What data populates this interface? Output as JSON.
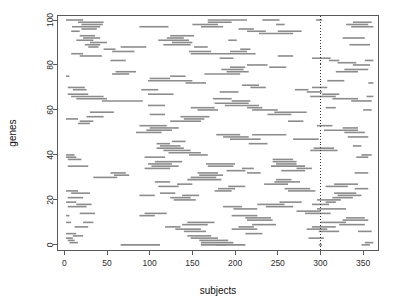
{
  "chart_data": {
    "type": "line",
    "title": "",
    "subtitle": "",
    "xlabel": "subjects",
    "ylabel": "genes",
    "xlim": [
      -8,
      368
    ],
    "ylim": [
      -2.5,
      102
    ],
    "xticks": [
      0,
      50,
      100,
      150,
      200,
      250,
      300,
      350
    ],
    "xtick_labels": [
      "0",
      "50",
      "100",
      "150",
      "200",
      "250",
      "300",
      "350"
    ],
    "yticks": [
      0,
      20,
      40,
      60,
      80,
      100
    ],
    "ytick_labels": [
      "0",
      "20",
      "40",
      "60",
      "80",
      "100"
    ],
    "grid": false,
    "legend": null,
    "series_color": "#8c8c8c",
    "annotations": [
      {
        "name": "reference-line",
        "type": "vline",
        "x": 300,
        "style": "dotted",
        "color": "#333333"
      }
    ],
    "segments": [
      {
        "gene": 100,
        "x0": 2,
        "x1": 22
      },
      {
        "gene": 100,
        "x0": 168,
        "x1": 214
      },
      {
        "gene": 100,
        "x0": 232,
        "x1": 252
      },
      {
        "gene": 100,
        "x0": 295,
        "x1": 302
      },
      {
        "gene": 99,
        "x0": 16,
        "x1": 46
      },
      {
        "gene": 99,
        "x0": 168,
        "x1": 196
      },
      {
        "gene": 99,
        "x0": 338,
        "x1": 360
      },
      {
        "gene": 98,
        "x0": 20,
        "x1": 45
      },
      {
        "gene": 98,
        "x0": 150,
        "x1": 180
      },
      {
        "gene": 98,
        "x0": 248,
        "x1": 258
      },
      {
        "gene": 98,
        "x0": 330,
        "x1": 356
      },
      {
        "gene": 97,
        "x0": 9,
        "x1": 42
      },
      {
        "gene": 97,
        "x0": 88,
        "x1": 122
      },
      {
        "gene": 97,
        "x0": 160,
        "x1": 186
      },
      {
        "gene": 97,
        "x0": 336,
        "x1": 362
      },
      {
        "gene": 96,
        "x0": 20,
        "x1": 38
      },
      {
        "gene": 96,
        "x0": 204,
        "x1": 222
      },
      {
        "gene": 95,
        "x0": 8,
        "x1": 18
      },
      {
        "gene": 95,
        "x0": 214,
        "x1": 236
      },
      {
        "gene": 95,
        "x0": 250,
        "x1": 278
      },
      {
        "gene": 94,
        "x0": 228,
        "x1": 268
      },
      {
        "gene": 93,
        "x0": 18,
        "x1": 36
      },
      {
        "gene": 93,
        "x0": 124,
        "x1": 152
      },
      {
        "gene": 92,
        "x0": 22,
        "x1": 42
      },
      {
        "gene": 92,
        "x0": 120,
        "x1": 140
      },
      {
        "gene": 92,
        "x0": 326,
        "x1": 352
      },
      {
        "gene": 91,
        "x0": 14,
        "x1": 34
      },
      {
        "gene": 91,
        "x0": 110,
        "x1": 146
      },
      {
        "gene": 91,
        "x0": 192,
        "x1": 202
      },
      {
        "gene": 90,
        "x0": 30,
        "x1": 50
      },
      {
        "gene": 90,
        "x0": 126,
        "x1": 150
      },
      {
        "gene": 89,
        "x0": 24,
        "x1": 42
      },
      {
        "gene": 89,
        "x0": 116,
        "x1": 148
      },
      {
        "gene": 89,
        "x0": 334,
        "x1": 358
      },
      {
        "gene": 88,
        "x0": 28,
        "x1": 40
      },
      {
        "gene": 88,
        "x0": 66,
        "x1": 96
      },
      {
        "gene": 88,
        "x0": 152,
        "x1": 168
      },
      {
        "gene": 87,
        "x0": 46,
        "x1": 60
      },
      {
        "gene": 87,
        "x0": 206,
        "x1": 218
      },
      {
        "gene": 86,
        "x0": 56,
        "x1": 82
      },
      {
        "gene": 86,
        "x0": 146,
        "x1": 172
      },
      {
        "gene": 86,
        "x0": 194,
        "x1": 214
      },
      {
        "gene": 85,
        "x0": 8,
        "x1": 22
      },
      {
        "gene": 85,
        "x0": 148,
        "x1": 224
      },
      {
        "gene": 84,
        "x0": 18,
        "x1": 44
      },
      {
        "gene": 84,
        "x0": 250,
        "x1": 268
      },
      {
        "gene": 83,
        "x0": 182,
        "x1": 198
      },
      {
        "gene": 83,
        "x0": 290,
        "x1": 312
      },
      {
        "gene": 82,
        "x0": 54,
        "x1": 72
      },
      {
        "gene": 82,
        "x0": 310,
        "x1": 322
      },
      {
        "gene": 82,
        "x0": 352,
        "x1": 362
      },
      {
        "gene": 81,
        "x0": 320,
        "x1": 342
      },
      {
        "gene": 80,
        "x0": 214,
        "x1": 238
      },
      {
        "gene": 80,
        "x0": 338,
        "x1": 358
      },
      {
        "gene": 79,
        "x0": 194,
        "x1": 212
      },
      {
        "gene": 79,
        "x0": 240,
        "x1": 260
      },
      {
        "gene": 78,
        "x0": 184,
        "x1": 210
      },
      {
        "gene": 78,
        "x0": 328,
        "x1": 356
      },
      {
        "gene": 77,
        "x0": 60,
        "x1": 84
      },
      {
        "gene": 77,
        "x0": 190,
        "x1": 216
      },
      {
        "gene": 77,
        "x0": 318,
        "x1": 344
      },
      {
        "gene": 76,
        "x0": 56,
        "x1": 76
      },
      {
        "gene": 76,
        "x0": 164,
        "x1": 206
      },
      {
        "gene": 75,
        "x0": 2,
        "x1": 6
      },
      {
        "gene": 75,
        "x0": 124,
        "x1": 142
      },
      {
        "gene": 74,
        "x0": 100,
        "x1": 124
      },
      {
        "gene": 73,
        "x0": 98,
        "x1": 150
      },
      {
        "gene": 73,
        "x0": 308,
        "x1": 328
      },
      {
        "gene": 72,
        "x0": 142,
        "x1": 166
      },
      {
        "gene": 72,
        "x0": 356,
        "x1": 362
      },
      {
        "gene": 71,
        "x0": 208,
        "x1": 228
      },
      {
        "gene": 70,
        "x0": 4,
        "x1": 24
      },
      {
        "gene": 70,
        "x0": 218,
        "x1": 236
      },
      {
        "gene": 70,
        "x0": 290,
        "x1": 308
      },
      {
        "gene": 69,
        "x0": 10,
        "x1": 26
      },
      {
        "gene": 69,
        "x0": 90,
        "x1": 110
      },
      {
        "gene": 69,
        "x0": 270,
        "x1": 286
      },
      {
        "gene": 68,
        "x0": 182,
        "x1": 204
      },
      {
        "gene": 68,
        "x0": 284,
        "x1": 302
      },
      {
        "gene": 67,
        "x0": 4,
        "x1": 28
      },
      {
        "gene": 67,
        "x0": 98,
        "x1": 128
      },
      {
        "gene": 67,
        "x0": 302,
        "x1": 322
      },
      {
        "gene": 66,
        "x0": 8,
        "x1": 46
      },
      {
        "gene": 66,
        "x0": 288,
        "x1": 318
      },
      {
        "gene": 66,
        "x0": 354,
        "x1": 362
      },
      {
        "gene": 65,
        "x0": 14,
        "x1": 50
      },
      {
        "gene": 65,
        "x0": 174,
        "x1": 196
      },
      {
        "gene": 65,
        "x0": 314,
        "x1": 344
      },
      {
        "gene": 64,
        "x0": 44,
        "x1": 92
      },
      {
        "gene": 64,
        "x0": 196,
        "x1": 218
      },
      {
        "gene": 64,
        "x0": 336,
        "x1": 360
      },
      {
        "gene": 63,
        "x0": 176,
        "x1": 216
      },
      {
        "gene": 62,
        "x0": 98,
        "x1": 118
      },
      {
        "gene": 62,
        "x0": 188,
        "x1": 228
      },
      {
        "gene": 61,
        "x0": 148,
        "x1": 176
      },
      {
        "gene": 61,
        "x0": 214,
        "x1": 232
      },
      {
        "gene": 61,
        "x0": 306,
        "x1": 318
      },
      {
        "gene": 60,
        "x0": 156,
        "x1": 180
      },
      {
        "gene": 60,
        "x0": 220,
        "x1": 250
      },
      {
        "gene": 60,
        "x0": 350,
        "x1": 360
      },
      {
        "gene": 59,
        "x0": 30,
        "x1": 58
      },
      {
        "gene": 59,
        "x0": 246,
        "x1": 284
      },
      {
        "gene": 58,
        "x0": 100,
        "x1": 118
      },
      {
        "gene": 58,
        "x0": 238,
        "x1": 266
      },
      {
        "gene": 57,
        "x0": 26,
        "x1": 46
      },
      {
        "gene": 57,
        "x0": 136,
        "x1": 170
      },
      {
        "gene": 56,
        "x0": 2,
        "x1": 16
      },
      {
        "gene": 56,
        "x0": 140,
        "x1": 164
      },
      {
        "gene": 55,
        "x0": 18,
        "x1": 34
      },
      {
        "gene": 55,
        "x0": 124,
        "x1": 160
      },
      {
        "gene": 55,
        "x0": 262,
        "x1": 280
      },
      {
        "gene": 54,
        "x0": 16,
        "x1": 30
      },
      {
        "gene": 53,
        "x0": 88,
        "x1": 120
      },
      {
        "gene": 53,
        "x0": 296,
        "x1": 314
      },
      {
        "gene": 52,
        "x0": 100,
        "x1": 134
      },
      {
        "gene": 52,
        "x0": 326,
        "x1": 344
      },
      {
        "gene": 51,
        "x0": 96,
        "x1": 126
      },
      {
        "gene": 51,
        "x0": 304,
        "x1": 344
      },
      {
        "gene": 50,
        "x0": 84,
        "x1": 114
      },
      {
        "gene": 50,
        "x0": 328,
        "x1": 352
      },
      {
        "gene": 49,
        "x0": 178,
        "x1": 206
      },
      {
        "gene": 49,
        "x0": 220,
        "x1": 260
      },
      {
        "gene": 48,
        "x0": 186,
        "x1": 216
      },
      {
        "gene": 48,
        "x0": 332,
        "x1": 356
      },
      {
        "gene": 47,
        "x0": 194,
        "x1": 230
      },
      {
        "gene": 47,
        "x0": 268,
        "x1": 298
      },
      {
        "gene": 46,
        "x0": 126,
        "x1": 142
      },
      {
        "gene": 45,
        "x0": 108,
        "x1": 124
      },
      {
        "gene": 45,
        "x0": 216,
        "x1": 238
      },
      {
        "gene": 44,
        "x0": 112,
        "x1": 136
      },
      {
        "gene": 44,
        "x0": 338,
        "x1": 348
      },
      {
        "gene": 43,
        "x0": 108,
        "x1": 140
      },
      {
        "gene": 43,
        "x0": 292,
        "x1": 316
      },
      {
        "gene": 42,
        "x0": 116,
        "x1": 148
      },
      {
        "gene": 42,
        "x0": 288,
        "x1": 320
      },
      {
        "gene": 41,
        "x0": 122,
        "x1": 160
      },
      {
        "gene": 40,
        "x0": 2,
        "x1": 12
      },
      {
        "gene": 40,
        "x0": 146,
        "x1": 168
      },
      {
        "gene": 40,
        "x0": 348,
        "x1": 360
      },
      {
        "gene": 39,
        "x0": 2,
        "x1": 14
      },
      {
        "gene": 39,
        "x0": 94,
        "x1": 118
      },
      {
        "gene": 39,
        "x0": 342,
        "x1": 356
      },
      {
        "gene": 38,
        "x0": 4,
        "x1": 20
      },
      {
        "gene": 38,
        "x0": 244,
        "x1": 268
      },
      {
        "gene": 37,
        "x0": 106,
        "x1": 138
      },
      {
        "gene": 37,
        "x0": 244,
        "x1": 272
      },
      {
        "gene": 36,
        "x0": 98,
        "x1": 126
      },
      {
        "gene": 36,
        "x0": 166,
        "x1": 200
      },
      {
        "gene": 36,
        "x0": 248,
        "x1": 272
      },
      {
        "gene": 35,
        "x0": 4,
        "x1": 28
      },
      {
        "gene": 35,
        "x0": 102,
        "x1": 134
      },
      {
        "gene": 35,
        "x0": 168,
        "x1": 198
      },
      {
        "gene": 35,
        "x0": 242,
        "x1": 282
      },
      {
        "gene": 34,
        "x0": 94,
        "x1": 124
      },
      {
        "gene": 34,
        "x0": 208,
        "x1": 222
      },
      {
        "gene": 34,
        "x0": 272,
        "x1": 290
      },
      {
        "gene": 33,
        "x0": 190,
        "x1": 212
      },
      {
        "gene": 33,
        "x0": 254,
        "x1": 282
      },
      {
        "gene": 32,
        "x0": 54,
        "x1": 72
      },
      {
        "gene": 32,
        "x0": 156,
        "x1": 180
      },
      {
        "gene": 32,
        "x0": 214,
        "x1": 230
      },
      {
        "gene": 32,
        "x0": 340,
        "x1": 356
      },
      {
        "gene": 31,
        "x0": 58,
        "x1": 76
      },
      {
        "gene": 31,
        "x0": 158,
        "x1": 186
      },
      {
        "gene": 30,
        "x0": 34,
        "x1": 62
      },
      {
        "gene": 30,
        "x0": 148,
        "x1": 178
      },
      {
        "gene": 29,
        "x0": 144,
        "x1": 184
      },
      {
        "gene": 29,
        "x0": 248,
        "x1": 266
      },
      {
        "gene": 28,
        "x0": 106,
        "x1": 124
      },
      {
        "gene": 28,
        "x0": 246,
        "x1": 276
      },
      {
        "gene": 27,
        "x0": 132,
        "x1": 150
      },
      {
        "gene": 27,
        "x0": 234,
        "x1": 262
      },
      {
        "gene": 27,
        "x0": 316,
        "x1": 344
      },
      {
        "gene": 26,
        "x0": 110,
        "x1": 134
      },
      {
        "gene": 26,
        "x0": 192,
        "x1": 212
      },
      {
        "gene": 26,
        "x0": 306,
        "x1": 332
      },
      {
        "gene": 25,
        "x0": 180,
        "x1": 200
      },
      {
        "gene": 25,
        "x0": 258,
        "x1": 288
      },
      {
        "gene": 25,
        "x0": 340,
        "x1": 356
      },
      {
        "gene": 24,
        "x0": 2,
        "x1": 16
      },
      {
        "gene": 24,
        "x0": 176,
        "x1": 196
      },
      {
        "gene": 24,
        "x0": 262,
        "x1": 294
      },
      {
        "gene": 23,
        "x0": 8,
        "x1": 30
      },
      {
        "gene": 23,
        "x0": 112,
        "x1": 130
      },
      {
        "gene": 23,
        "x0": 316,
        "x1": 342
      },
      {
        "gene": 22,
        "x0": 88,
        "x1": 106
      },
      {
        "gene": 22,
        "x0": 138,
        "x1": 158
      },
      {
        "gene": 22,
        "x0": 320,
        "x1": 348
      },
      {
        "gene": 21,
        "x0": 4,
        "x1": 22
      },
      {
        "gene": 21,
        "x0": 124,
        "x1": 148
      },
      {
        "gene": 21,
        "x0": 314,
        "x1": 338
      },
      {
        "gene": 20,
        "x0": 128,
        "x1": 154
      },
      {
        "gene": 20,
        "x0": 296,
        "x1": 324
      },
      {
        "gene": 19,
        "x0": 2,
        "x1": 14
      },
      {
        "gene": 19,
        "x0": 252,
        "x1": 278
      },
      {
        "gene": 19,
        "x0": 306,
        "x1": 318
      },
      {
        "gene": 18,
        "x0": 14,
        "x1": 32
      },
      {
        "gene": 18,
        "x0": 226,
        "x1": 258
      },
      {
        "gene": 18,
        "x0": 290,
        "x1": 310
      },
      {
        "gene": 17,
        "x0": 4,
        "x1": 26
      },
      {
        "gene": 17,
        "x0": 186,
        "x1": 208
      },
      {
        "gene": 17,
        "x0": 236,
        "x1": 268
      },
      {
        "gene": 16,
        "x0": 198,
        "x1": 226
      },
      {
        "gene": 16,
        "x0": 296,
        "x1": 330
      },
      {
        "gene": 15,
        "x0": 272,
        "x1": 300
      },
      {
        "gene": 14,
        "x0": 18,
        "x1": 36
      },
      {
        "gene": 14,
        "x0": 94,
        "x1": 120
      },
      {
        "gene": 14,
        "x0": 282,
        "x1": 312
      },
      {
        "gene": 13,
        "x0": 2,
        "x1": 6
      },
      {
        "gene": 13,
        "x0": 88,
        "x1": 106
      },
      {
        "gene": 13,
        "x0": 196,
        "x1": 226
      },
      {
        "gene": 12,
        "x0": 212,
        "x1": 242
      },
      {
        "gene": 12,
        "x0": 330,
        "x1": 352
      },
      {
        "gene": 11,
        "x0": 214,
        "x1": 244
      },
      {
        "gene": 11,
        "x0": 326,
        "x1": 356
      },
      {
        "gene": 10,
        "x0": 2,
        "x1": 8
      },
      {
        "gene": 10,
        "x0": 22,
        "x1": 34
      },
      {
        "gene": 10,
        "x0": 144,
        "x1": 176
      },
      {
        "gene": 10,
        "x0": 300,
        "x1": 330
      },
      {
        "gene": 9,
        "x0": 138,
        "x1": 168
      },
      {
        "gene": 9,
        "x0": 220,
        "x1": 248
      },
      {
        "gene": 9,
        "x0": 322,
        "x1": 352
      },
      {
        "gene": 8,
        "x0": 12,
        "x1": 28
      },
      {
        "gene": 8,
        "x0": 118,
        "x1": 136
      },
      {
        "gene": 8,
        "x0": 204,
        "x1": 222
      },
      {
        "gene": 8,
        "x0": 290,
        "x1": 318
      },
      {
        "gene": 7,
        "x0": 130,
        "x1": 160
      },
      {
        "gene": 7,
        "x0": 196,
        "x1": 226
      },
      {
        "gene": 7,
        "x0": 284,
        "x1": 308
      },
      {
        "gene": 6,
        "x0": 140,
        "x1": 166
      },
      {
        "gene": 6,
        "x0": 298,
        "x1": 322
      },
      {
        "gene": 6,
        "x0": 344,
        "x1": 360
      },
      {
        "gene": 5,
        "x0": 2,
        "x1": 14
      },
      {
        "gene": 5,
        "x0": 212,
        "x1": 232
      },
      {
        "gene": 4,
        "x0": 10,
        "x1": 22
      },
      {
        "gene": 4,
        "x0": 144,
        "x1": 172
      },
      {
        "gene": 3,
        "x0": 2,
        "x1": 10
      },
      {
        "gene": 3,
        "x0": 148,
        "x1": 180
      },
      {
        "gene": 3,
        "x0": 286,
        "x1": 304
      },
      {
        "gene": 2,
        "x0": 4,
        "x1": 12
      },
      {
        "gene": 2,
        "x0": 158,
        "x1": 192
      },
      {
        "gene": 1,
        "x0": 6,
        "x1": 16
      },
      {
        "gene": 1,
        "x0": 160,
        "x1": 198
      },
      {
        "gene": 1,
        "x0": 352,
        "x1": 362
      },
      {
        "gene": 0,
        "x0": 66,
        "x1": 112
      },
      {
        "gene": 0,
        "x0": 160,
        "x1": 212
      },
      {
        "gene": 0,
        "x0": 178,
        "x1": 190
      },
      {
        "gene": 0,
        "x0": 298,
        "x1": 302
      },
      {
        "gene": 0,
        "x0": 348,
        "x1": 358
      }
    ]
  }
}
